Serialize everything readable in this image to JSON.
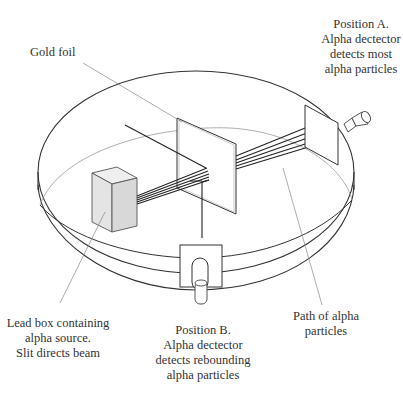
{
  "labels": {
    "gold_foil": {
      "lines": [
        "Gold foil"
      ]
    },
    "position_a": {
      "lines": [
        "Position A.",
        "Alpha dectector",
        "detects most",
        "alpha particles"
      ]
    },
    "lead_box": {
      "lines": [
        "Lead box containing",
        "alpha source.",
        "Slit directs beam"
      ]
    },
    "position_b": {
      "lines": [
        "Position B.",
        "Alpha dectector",
        "detects rebounding",
        "alpha particles"
      ]
    },
    "path": {
      "lines": [
        "Path of alpha",
        "particles"
      ]
    }
  },
  "colors": {
    "outline": "#333333",
    "leader_line": "#888888",
    "lead_box_fill": "#e4e4e4",
    "foil_fill": "#ffffff",
    "background": "#ffffff"
  }
}
